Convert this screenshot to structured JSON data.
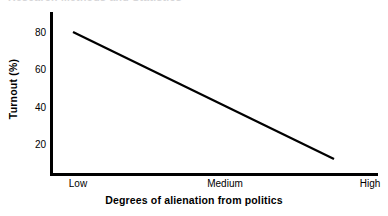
{
  "figure": {
    "clipped_heading_remnant": "Research  Methods and Statistics",
    "background_color": "#ffffff",
    "ink_color": "#000000"
  },
  "chart_data": {
    "type": "line",
    "title": "",
    "xlabel": "Degrees of alienation from politics",
    "ylabel": "Turnout (%)",
    "x_categories": [
      "Low",
      "Medium",
      "High"
    ],
    "x_tick_labels": [
      "Low",
      "Medium",
      "High"
    ],
    "y_tick_labels": [
      "20",
      "40",
      "60",
      "80"
    ],
    "y_ticks": [
      20,
      40,
      60,
      80
    ],
    "ylim": [
      0,
      90
    ],
    "grid": false,
    "legend": false,
    "series": [
      {
        "name": "Turnout",
        "color": "#000000",
        "points": [
          {
            "x_label": "Low",
            "x_frac": 0.075,
            "y": 80
          },
          {
            "x_label": "High",
            "x_frac": 0.87,
            "y": 13
          }
        ],
        "values": [
          80,
          13
        ],
        "description": "Straight declining line from 80% turnout at low alienation to about 13% turnout at high alienation"
      }
    ]
  },
  "axis_geometry": {
    "x_low_label_center": 78,
    "x_medium_label_center": 225,
    "x_high_label_center": 370,
    "line_start_px": {
      "x": 73,
      "y": 32
    },
    "line_end_px": {
      "x": 334,
      "y": 159
    }
  }
}
